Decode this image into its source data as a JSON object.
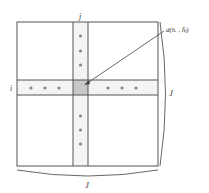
{
  "diagram": {
    "type": "matrix-cross-diagram",
    "labels": {
      "row": "i",
      "column": "j",
      "right_dimension": "J",
      "bottom_dimension": "J",
      "cell_annotation": "d(hᵢ , h̄ⱼ)"
    },
    "outer_box": {
      "x": 17,
      "y": 22,
      "width": 141,
      "height": 144
    },
    "column_strip": {
      "x1": 73,
      "x2": 88
    },
    "row_strip": {
      "y1": 80,
      "y2": 95
    },
    "highlight_cell": {
      "x": 73,
      "y": 80,
      "width": 15,
      "height": 15,
      "color": "#c8c8c8"
    },
    "dots": {
      "column_top": [
        36,
        51,
        65
      ],
      "column_bottom": [
        116,
        130,
        144
      ],
      "row_left": [
        31,
        45,
        59
      ],
      "row_right": [
        108,
        122,
        136
      ]
    },
    "arrow": {
      "from": [
        163,
        32
      ],
      "to": [
        84,
        85
      ]
    },
    "colors": {
      "line": "#555555",
      "strip_fill": "#f4f4f4",
      "dot": "#888888",
      "text": "#333333"
    }
  }
}
